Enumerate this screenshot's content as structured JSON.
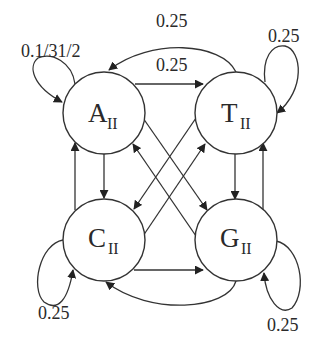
{
  "diagram": {
    "type": "state-transition-graph",
    "nodes": [
      {
        "id": "A",
        "letter": "A",
        "subscript": "II"
      },
      {
        "id": "T",
        "letter": "T",
        "subscript": "II"
      },
      {
        "id": "C",
        "letter": "C",
        "subscript": "II"
      },
      {
        "id": "G",
        "letter": "G",
        "subscript": "II"
      }
    ],
    "edge_labels": {
      "A_self": "0.1/31/2",
      "T_to_A": "0.25",
      "A_to_T": "0.25",
      "T_self": "0.25",
      "C_self": "0.25",
      "G_self": "0.25"
    },
    "edges": [
      {
        "from": "A",
        "to": "A",
        "label": "0.1/31/2"
      },
      {
        "from": "T",
        "to": "A",
        "label": "0.25"
      },
      {
        "from": "A",
        "to": "T",
        "label": "0.25"
      },
      {
        "from": "T",
        "to": "T",
        "label": "0.25"
      },
      {
        "from": "A",
        "to": "C"
      },
      {
        "from": "C",
        "to": "A"
      },
      {
        "from": "T",
        "to": "G"
      },
      {
        "from": "G",
        "to": "T"
      },
      {
        "from": "A",
        "to": "G"
      },
      {
        "from": "G",
        "to": "A"
      },
      {
        "from": "T",
        "to": "C"
      },
      {
        "from": "C",
        "to": "T"
      },
      {
        "from": "C",
        "to": "G"
      },
      {
        "from": "G",
        "to": "C"
      },
      {
        "from": "C",
        "to": "C",
        "label": "0.25"
      },
      {
        "from": "G",
        "to": "G",
        "label": "0.25"
      }
    ],
    "colors": {
      "stroke": "#333333",
      "background": "#ffffff",
      "text": "#2a2a2a"
    }
  }
}
